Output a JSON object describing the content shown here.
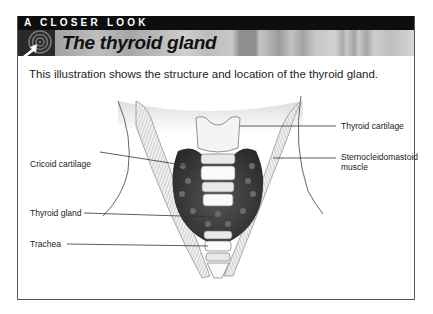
{
  "header": {
    "kicker": "A CLOSER LOOK",
    "title": "The thyroid gland",
    "logo_icon": "target-arrow-icon"
  },
  "intro_text": "This illustration shows the structure and location of the thyroid gland.",
  "illustration": {
    "subject": "thyroid-gland-anatomy",
    "labels": {
      "thyroid_cartilage": "Thyroid cartilage",
      "sternocleidomastoid_line1": "Sternocleidomastoid",
      "sternocleidomastoid_line2": "muscle",
      "cricoid_cartilage": "Cricoid cartilage",
      "thyroid_gland": "Thyroid gland",
      "trachea": "Trachea"
    }
  },
  "colors": {
    "header_bar": "#0e0e0e",
    "frame_border": "#555555",
    "text": "#222222"
  }
}
